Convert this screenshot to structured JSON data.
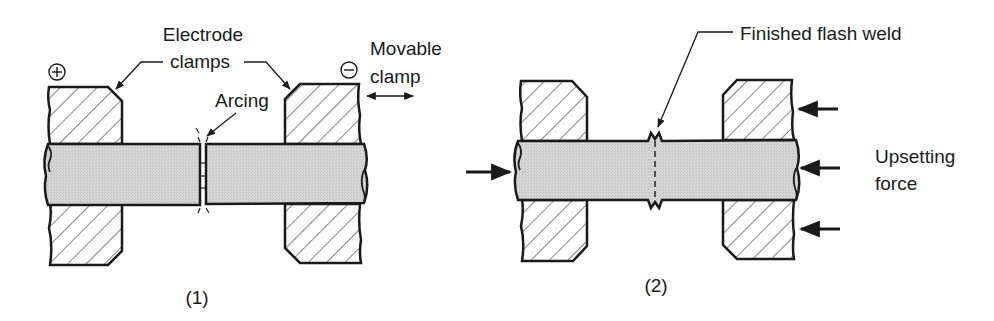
{
  "figure": {
    "panels": [
      {
        "id": "panel-1",
        "caption": "(1)",
        "labels": {
          "electrode_line1": "Electrode",
          "electrode_line2": "clamps",
          "arcing": "Arcing",
          "movable_line1": "Movable",
          "movable_line2": "clamp"
        },
        "symbols": {
          "positive": "plus-circle",
          "negative": "minus-circle"
        }
      },
      {
        "id": "panel-2",
        "caption": "(2)",
        "labels": {
          "finished_weld": "Finished flash weld",
          "upsetting_line1": "Upsetting",
          "upsetting_line2": "force"
        }
      }
    ]
  },
  "colors": {
    "stroke": "#1a1a1a",
    "rod_fill": "#d4d4d4",
    "background": "#ffffff"
  }
}
